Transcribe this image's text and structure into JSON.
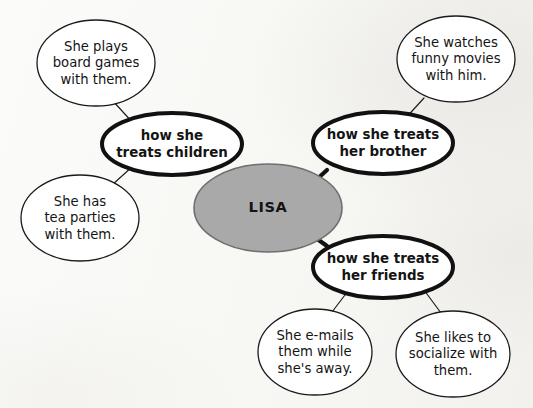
{
  "diagram": {
    "type": "mind-map",
    "width": 533,
    "height": 408,
    "colors": {
      "background": "#f8f8f6",
      "center_fill": "#a9a9a9",
      "center_stroke": "#6f6f6f",
      "node_fill": "#ffffff",
      "stroke": "#1a1a1a",
      "text": "#141414"
    }
  },
  "center": {
    "id": "lisa",
    "label": "LISA",
    "cx": 268,
    "cy": 208,
    "rx": 74,
    "ry": 44
  },
  "branches": [
    {
      "id": "children",
      "lines": [
        "how she",
        "treats children"
      ],
      "cx": 172,
      "cy": 144,
      "rx": 70,
      "ry": 31
    },
    {
      "id": "brother",
      "lines": [
        "how she treats",
        "her brother"
      ],
      "cx": 383,
      "cy": 143,
      "rx": 70,
      "ry": 31
    },
    {
      "id": "friends",
      "lines": [
        "how she treats",
        "her friends"
      ],
      "cx": 383,
      "cy": 267,
      "rx": 70,
      "ry": 31
    }
  ],
  "leaves": [
    {
      "id": "board-games",
      "parent": "children",
      "lines": [
        "She plays",
        "board games",
        "with them."
      ],
      "cx": 96,
      "cy": 63,
      "rx": 59,
      "ry": 43
    },
    {
      "id": "tea-parties",
      "parent": "children",
      "lines": [
        "She has",
        "tea parties",
        "with them."
      ],
      "cx": 80,
      "cy": 218,
      "rx": 59,
      "ry": 43
    },
    {
      "id": "funny-movies",
      "parent": "brother",
      "lines": [
        "She watches",
        "funny movies",
        "with him."
      ],
      "cx": 456,
      "cy": 59,
      "rx": 59,
      "ry": 43
    },
    {
      "id": "emails",
      "parent": "friends",
      "lines": [
        "She e-mails",
        "them while",
        "she's away."
      ],
      "cx": 315,
      "cy": 352,
      "rx": 57,
      "ry": 43
    },
    {
      "id": "socialize",
      "parent": "friends",
      "lines": [
        "She likes to",
        "socialize with",
        "them."
      ],
      "cx": 453,
      "cy": 354,
      "rx": 57,
      "ry": 43
    }
  ],
  "connectors": [
    {
      "id": "lisa-children",
      "weight": "thick",
      "x1": 224,
      "y1": 177,
      "x2": 234,
      "y2": 186
    },
    {
      "id": "lisa-brother",
      "weight": "thick",
      "x1": 315,
      "y1": 181,
      "x2": 327,
      "y2": 170
    },
    {
      "id": "lisa-friends",
      "weight": "thick",
      "x1": 313,
      "y1": 236,
      "x2": 327,
      "y2": 246
    },
    {
      "id": "children-board-games",
      "weight": "thin",
      "x1": 112,
      "y1": 100,
      "x2": 134,
      "y2": 124
    },
    {
      "id": "children-tea-parties",
      "weight": "thin",
      "x1": 133,
      "y1": 166,
      "x2": 112,
      "y2": 185
    },
    {
      "id": "brother-funny-movies",
      "weight": "thin",
      "x1": 424,
      "y1": 98,
      "x2": 403,
      "y2": 121
    },
    {
      "id": "friends-emails",
      "weight": "thin",
      "x1": 348,
      "y1": 291,
      "x2": 332,
      "y2": 312
    },
    {
      "id": "friends-socialize",
      "weight": "thin",
      "x1": 424,
      "y1": 290,
      "x2": 441,
      "y2": 313
    }
  ]
}
